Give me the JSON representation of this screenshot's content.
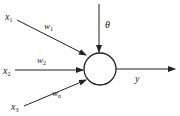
{
  "diagram": {
    "inputs": [
      {
        "label": "x",
        "sub": "1",
        "weight": "w",
        "weight_sub": "1"
      },
      {
        "label": "x",
        "sub": "2",
        "weight": "w",
        "weight_sub": "2"
      },
      {
        "label": "x",
        "sub": "3",
        "weight": "w",
        "weight_sub": "n"
      }
    ],
    "threshold": "θ",
    "output": "y",
    "colors": {
      "stroke": "#222222",
      "background": "#ffffff"
    }
  }
}
